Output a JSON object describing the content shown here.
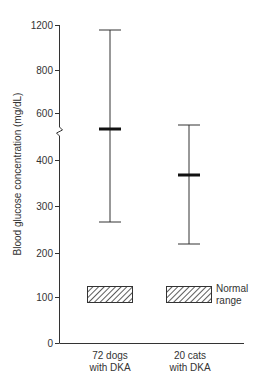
{
  "chart_data": {
    "type": "range",
    "title": "",
    "xlabel": "",
    "ylabel": "Blood glucose concentration (mg/dL)",
    "y_ticks": [
      0,
      100,
      200,
      300,
      400,
      600,
      800,
      1200
    ],
    "y_tick_positions_px": [
      343,
      297,
      253,
      206,
      160,
      113,
      70,
      25
    ],
    "axis_break": {
      "between": [
        400,
        600
      ],
      "y_px": 131
    },
    "categories": [
      "72 dogs\nwith DKA",
      "20 cats\nwith DKA"
    ],
    "category_lines": [
      [
        "72 dogs",
        "with DKA"
      ],
      [
        "20 cats",
        "with DKA"
      ]
    ],
    "series": [
      {
        "name": "72 dogs with DKA",
        "median": 530,
        "min": 265,
        "max": 1155,
        "px": {
          "x": 110,
          "top": 30,
          "median": 129,
          "bottom": 222
        }
      },
      {
        "name": "20 cats with DKA",
        "median": 370,
        "min": 218,
        "max": 560,
        "px": {
          "x": 189,
          "top": 125,
          "median": 175,
          "bottom": 244
        }
      }
    ],
    "normal_range": {
      "label_lines": [
        "Normal",
        "range"
      ],
      "low": 88,
      "high": 125,
      "px": {
        "top": 286,
        "bottom": 302
      }
    },
    "grid": false,
    "legend_position": "right of cat normal-range box"
  }
}
